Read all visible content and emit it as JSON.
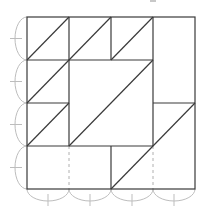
{
  "diagram": {
    "type": "quilt-block-pattern",
    "grid": {
      "rows": 4,
      "cols": 4,
      "origin_px": [
        27,
        17
      ],
      "cell_px": 42,
      "line_color": "#3a3a3a",
      "guide_color": "#bdbdbd"
    },
    "pieces": [
      {
        "name": "half-square-triangle",
        "cell": [
          0,
          0
        ],
        "diagonal": "bottom-left-to-top-right"
      },
      {
        "name": "half-square-triangle",
        "cell": [
          0,
          1
        ],
        "diagonal": "bottom-left-to-top-right"
      },
      {
        "name": "half-square-triangle",
        "cell": [
          0,
          2
        ],
        "diagonal": "bottom-left-to-top-right"
      },
      {
        "name": "rectangle",
        "cells": [
          [
            0,
            3
          ],
          [
            1,
            3
          ]
        ]
      },
      {
        "name": "half-square-triangle",
        "cell": [
          1,
          0
        ],
        "diagonal": "bottom-left-to-top-right"
      },
      {
        "name": "large-half-square-triangle",
        "cells": [
          [
            1,
            1
          ],
          [
            1,
            2
          ],
          [
            2,
            1
          ],
          [
            2,
            2
          ]
        ],
        "diagonal": "bottom-left-to-top-right"
      },
      {
        "name": "half-square-triangle",
        "cell": [
          2,
          0
        ],
        "diagonal": "bottom-left-to-top-right"
      },
      {
        "name": "parallelogram-strip",
        "cells": [
          [
            2,
            3
          ],
          [
            3,
            2
          ],
          [
            3,
            3
          ]
        ],
        "diagonal": "bottom-left-to-top-right"
      },
      {
        "name": "rectangle",
        "cells": [
          [
            3,
            0
          ],
          [
            3,
            1
          ]
        ]
      }
    ],
    "dashed_guides": [
      {
        "from": [
          69,
          146
        ],
        "to": [
          69,
          189
        ]
      },
      {
        "from": [
          153,
          146
        ],
        "to": [
          153,
          189
        ]
      }
    ],
    "side_arcs": {
      "left": 4,
      "bottom": 4
    }
  }
}
